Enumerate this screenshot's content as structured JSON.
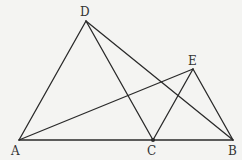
{
  "diagram": {
    "type": "geometry",
    "points": {
      "A": {
        "x": 19,
        "y": 140,
        "label": "A",
        "lx": 11,
        "ly": 155
      },
      "B": {
        "x": 233,
        "y": 140,
        "label": "B",
        "lx": 228,
        "ly": 155
      },
      "C": {
        "x": 153,
        "y": 140,
        "label": "C",
        "lx": 147,
        "ly": 155
      },
      "D": {
        "x": 86,
        "y": 21,
        "label": "D",
        "lx": 80,
        "ly": 16
      },
      "E": {
        "x": 193,
        "y": 69,
        "label": "E",
        "lx": 188,
        "ly": 65
      }
    },
    "segments": [
      [
        "A",
        "D"
      ],
      [
        "D",
        "C"
      ],
      [
        "D",
        "B"
      ],
      [
        "A",
        "B"
      ],
      [
        "A",
        "E"
      ],
      [
        "C",
        "E"
      ],
      [
        "E",
        "B"
      ]
    ],
    "dots": [
      "C"
    ],
    "colors": {
      "line": "#2a2a2a",
      "label": "#333333",
      "background": "#f4f4f2"
    }
  }
}
